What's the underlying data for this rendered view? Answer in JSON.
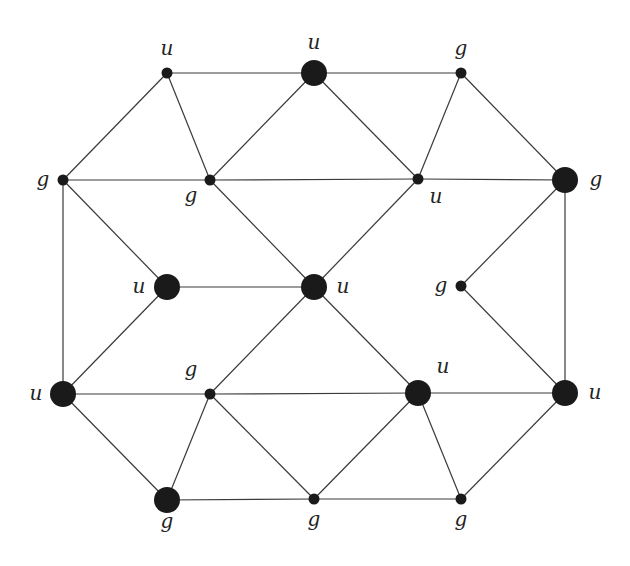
{
  "diagram": {
    "type": "graph",
    "colors": {
      "edge": "#3a3a3a",
      "node": "#1a1a1a",
      "label": "#222222",
      "background": "#ffffff"
    },
    "nodes": [
      {
        "id": "n1",
        "x": 167,
        "y": 73,
        "size": "small",
        "label": "u",
        "lx": 167,
        "ly": 55
      },
      {
        "id": "n2",
        "x": 314,
        "y": 73,
        "size": "large",
        "label": "u",
        "lx": 314,
        "ly": 49
      },
      {
        "id": "n3",
        "x": 461,
        "y": 73,
        "size": "small",
        "label": "g",
        "lx": 461,
        "ly": 55
      },
      {
        "id": "n4",
        "x": 63,
        "y": 180,
        "size": "small",
        "label": "g",
        "lx": 43,
        "ly": 186
      },
      {
        "id": "n5",
        "x": 210,
        "y": 180,
        "size": "small",
        "label": "g",
        "lx": 191,
        "ly": 202
      },
      {
        "id": "n6",
        "x": 418,
        "y": 179,
        "size": "small",
        "label": "u",
        "lx": 436,
        "ly": 203
      },
      {
        "id": "n7",
        "x": 565,
        "y": 180,
        "size": "large",
        "label": "g",
        "lx": 596,
        "ly": 186
      },
      {
        "id": "n8",
        "x": 167,
        "y": 287,
        "size": "large",
        "label": "u",
        "lx": 139,
        "ly": 293
      },
      {
        "id": "n9",
        "x": 314,
        "y": 287,
        "size": "large",
        "label": "u",
        "lx": 343,
        "ly": 293
      },
      {
        "id": "n10",
        "x": 461,
        "y": 286,
        "size": "small",
        "label": "g",
        "lx": 441,
        "ly": 292
      },
      {
        "id": "n11",
        "x": 63,
        "y": 394,
        "size": "large",
        "label": "u",
        "lx": 36,
        "ly": 400
      },
      {
        "id": "n12",
        "x": 210,
        "y": 394,
        "size": "small",
        "label": "g",
        "lx": 191,
        "ly": 376
      },
      {
        "id": "n13",
        "x": 418,
        "y": 393,
        "size": "large",
        "label": "u",
        "lx": 443,
        "ly": 373
      },
      {
        "id": "n14",
        "x": 565,
        "y": 393,
        "size": "large",
        "label": "u",
        "lx": 595,
        "ly": 399
      },
      {
        "id": "n15",
        "x": 167,
        "y": 500,
        "size": "large",
        "label": "g",
        "lx": 167,
        "ly": 528
      },
      {
        "id": "n16",
        "x": 314,
        "y": 499,
        "size": "small",
        "label": "g",
        "lx": 314,
        "ly": 526
      },
      {
        "id": "n17",
        "x": 461,
        "y": 499,
        "size": "small",
        "label": "g",
        "lx": 461,
        "ly": 526
      }
    ],
    "edges": [
      [
        "n1",
        "n2"
      ],
      [
        "n2",
        "n3"
      ],
      [
        "n1",
        "n4"
      ],
      [
        "n1",
        "n5"
      ],
      [
        "n2",
        "n5"
      ],
      [
        "n2",
        "n6"
      ],
      [
        "n3",
        "n6"
      ],
      [
        "n3",
        "n7"
      ],
      [
        "n4",
        "n5"
      ],
      [
        "n5",
        "n6"
      ],
      [
        "n6",
        "n7"
      ],
      [
        "n4",
        "n8"
      ],
      [
        "n4",
        "n11"
      ],
      [
        "n5",
        "n9"
      ],
      [
        "n6",
        "n9"
      ],
      [
        "n8",
        "n9"
      ],
      [
        "n7",
        "n10"
      ],
      [
        "n7",
        "n14"
      ],
      [
        "n10",
        "n14"
      ],
      [
        "n8",
        "n11"
      ],
      [
        "n9",
        "n12"
      ],
      [
        "n9",
        "n13"
      ],
      [
        "n11",
        "n12"
      ],
      [
        "n12",
        "n13"
      ],
      [
        "n13",
        "n14"
      ],
      [
        "n11",
        "n15"
      ],
      [
        "n12",
        "n15"
      ],
      [
        "n12",
        "n16"
      ],
      [
        "n13",
        "n16"
      ],
      [
        "n13",
        "n17"
      ],
      [
        "n14",
        "n17"
      ],
      [
        "n15",
        "n16"
      ],
      [
        "n16",
        "n17"
      ]
    ]
  }
}
